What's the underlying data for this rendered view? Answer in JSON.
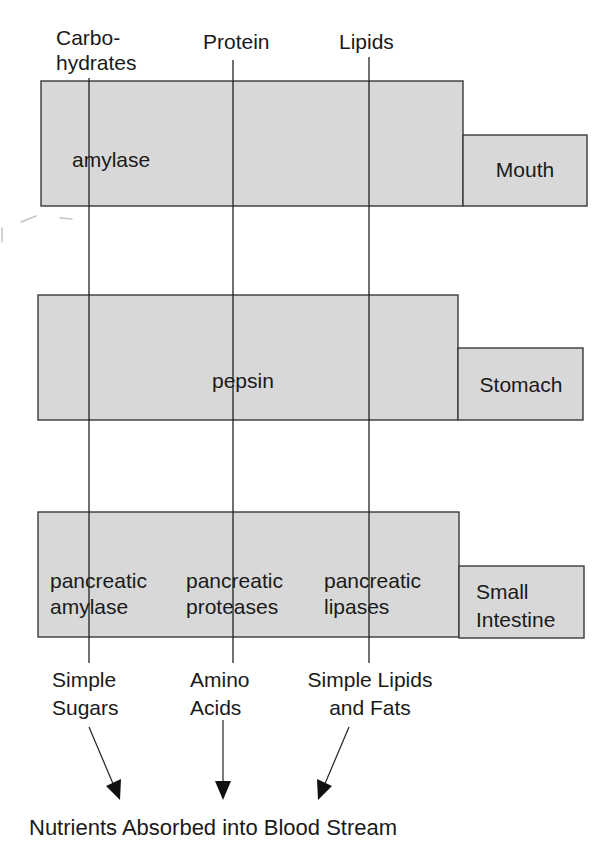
{
  "diagram": {
    "nutrients": [
      {
        "id": "carbohydrates",
        "label_line1": "Carbo-",
        "label_line2": "hydrates",
        "x": 89
      },
      {
        "id": "protein",
        "label_line1": "Protein",
        "label_line2": "",
        "x": 233
      },
      {
        "id": "lipids",
        "label_line1": "Lipids",
        "label_line2": "",
        "x": 369
      }
    ],
    "organs": [
      {
        "name": "Mouth",
        "enzymes": [
          {
            "nutrient": "carbohydrates",
            "line1": "amylase",
            "line2": ""
          }
        ]
      },
      {
        "name": "Stomach",
        "enzymes": [
          {
            "nutrient": "protein",
            "line1": "pepsin",
            "line2": ""
          }
        ]
      },
      {
        "name_line1": "Small",
        "name_line2": "Intestine",
        "enzymes": [
          {
            "nutrient": "carbohydrates",
            "line1": "pancreatic",
            "line2": "amylase"
          },
          {
            "nutrient": "protein",
            "line1": "pancreatic",
            "line2": "proteases"
          },
          {
            "nutrient": "lipids",
            "line1": "pancreatic",
            "line2": "lipases"
          }
        ]
      }
    ],
    "products": [
      {
        "nutrient": "carbohydrates",
        "line1": "Simple",
        "line2": "Sugars"
      },
      {
        "nutrient": "protein",
        "line1": "Amino",
        "line2": "Acids"
      },
      {
        "nutrient": "lipids",
        "line1": "Simple Lipids",
        "line2": "and Fats"
      }
    ],
    "result": "Nutrients Absorbed into Blood Stream",
    "colors": {
      "box_fill": "#d8d8d8",
      "box_stroke": "#3a3a3a",
      "line": "#222222",
      "text": "#1a1a1a"
    }
  }
}
